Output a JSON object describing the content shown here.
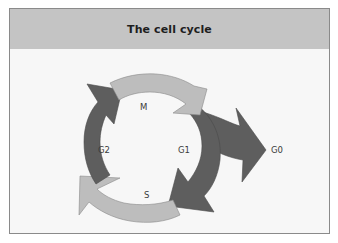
{
  "header": {
    "title": "The cell cycle"
  },
  "diagram": {
    "labels": {
      "m": "M",
      "g1": "G1",
      "s": "S",
      "g2": "G2",
      "g0": "G0"
    },
    "phases": [
      {
        "name": "M",
        "color": "#bdbdbd",
        "position": "top"
      },
      {
        "name": "G1",
        "color": "#5e5e5e",
        "position": "right"
      },
      {
        "name": "S",
        "color": "#bdbdbd",
        "position": "bottom"
      },
      {
        "name": "G2",
        "color": "#5e5e5e",
        "position": "left"
      }
    ],
    "exit_arrow": {
      "from": "G1",
      "to": "G0",
      "color": "#5e5e5e"
    },
    "colors": {
      "light_arrow": "#bdbdbd",
      "dark_arrow": "#5e5e5e",
      "header_bg": "#c4c4c4",
      "panel_bg": "#f7f7f7"
    }
  }
}
